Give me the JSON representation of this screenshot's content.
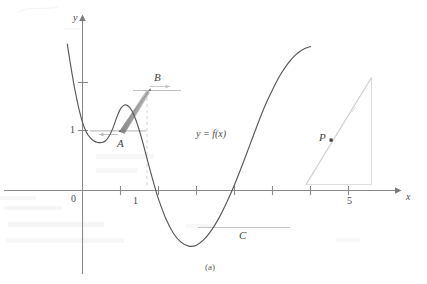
{
  "figure": {
    "caption": "(a)",
    "function_label": "y = f(x)",
    "axes": {
      "x_axis_label": "x",
      "y_axis_label": "y",
      "origin_label": "0",
      "x_tick_labels": [
        "1",
        "5"
      ]
    },
    "points": [
      {
        "id": "A",
        "label": "A",
        "note": "local minimum, horizontal tangent"
      },
      {
        "id": "B",
        "label": "B",
        "note": "local maximum, horizontal tangent"
      },
      {
        "id": "C",
        "label": "C",
        "note": "local minimum, horizontal tangent"
      },
      {
        "id": "P",
        "label": "P",
        "note": "point on rising branch with tangent line"
      }
    ],
    "colors": {
      "curve": "#58585a",
      "axis": "#8a8a8c",
      "tangent": "#bdbdbd",
      "shade": "#9a9a9c",
      "guide": "#c9c9c9",
      "label": "#4a4a4a",
      "bleed": "#e6e6e6",
      "background": "#ffffff"
    }
  },
  "chart_data": {
    "type": "line",
    "title": "",
    "xlabel": "x",
    "ylabel": "y",
    "xlim": [
      -0.55,
      6.4
    ],
    "ylim": [
      -1.35,
      3.05
    ],
    "grid": false,
    "legend": false,
    "x_ticks": [
      0,
      1,
      2,
      3,
      4,
      5
    ],
    "x_tick_labels": [
      "0",
      "1",
      "",
      "",
      "",
      "5"
    ],
    "y_ticks": [
      1,
      2
    ],
    "y_tick_labels": [
      "1",
      ""
    ],
    "series": [
      {
        "name": "y = f(x)",
        "x": [
          -0.4,
          -0.3,
          -0.2,
          -0.1,
          0.0,
          0.1,
          0.2,
          0.3,
          0.4,
          0.5,
          0.6,
          0.7,
          0.8,
          0.9,
          1.0,
          1.1,
          1.2,
          1.3,
          1.4,
          1.5,
          1.6,
          1.7,
          1.8,
          1.9,
          2.0,
          2.2,
          2.4,
          2.6,
          2.8,
          3.0,
          3.2,
          3.4,
          3.6,
          3.8,
          4.0,
          4.2,
          4.4,
          4.6,
          4.8,
          5.0,
          5.2,
          5.4,
          5.6,
          5.8,
          6.0
        ],
        "y": [
          3.05,
          2.55,
          2.1,
          1.72,
          1.42,
          1.22,
          1.1,
          1.03,
          1.0,
          1.0,
          1.03,
          1.13,
          1.3,
          1.52,
          1.7,
          1.78,
          1.76,
          1.66,
          1.48,
          1.24,
          0.96,
          0.66,
          0.36,
          0.08,
          -0.18,
          -0.6,
          -0.9,
          -1.08,
          -1.16,
          -1.14,
          -1.02,
          -0.82,
          -0.56,
          -0.24,
          0.12,
          0.52,
          0.94,
          1.36,
          1.76,
          2.1,
          2.4,
          2.64,
          2.82,
          2.94,
          3.0
        ]
      }
    ],
    "annotations": [
      {
        "label": "A",
        "x": 0.52,
        "y": 1.0,
        "kind": "local-minimum"
      },
      {
        "label": "B",
        "x": 1.14,
        "y": 1.78,
        "kind": "local-maximum"
      },
      {
        "label": "C",
        "x": 2.85,
        "y": -1.17,
        "kind": "local-minimum"
      },
      {
        "label": "P",
        "x": 5.0,
        "y": 2.1,
        "kind": "tangent-point"
      },
      {
        "label": "y = f(x)",
        "x": 2.1,
        "y": 1.05,
        "kind": "curve-label"
      }
    ]
  }
}
